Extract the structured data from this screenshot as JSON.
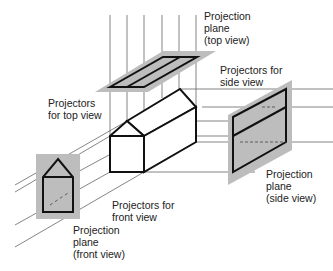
{
  "diagram": {
    "labels": {
      "top_plane": "Projection\nplane\n(top view)",
      "side_projectors": "Projectors for\nside view",
      "top_projectors": "Projectors\nfor top view",
      "side_plane": "Projection\nplane\n(side view)",
      "front_projectors": "Projectors for\nfront view",
      "front_plane": "Projection\nplane\n(front view)"
    },
    "colors": {
      "plane_fill": "#bdbdbd",
      "object_stroke": "#111111",
      "projector_stroke": "#666666",
      "background": "#ffffff"
    }
  }
}
